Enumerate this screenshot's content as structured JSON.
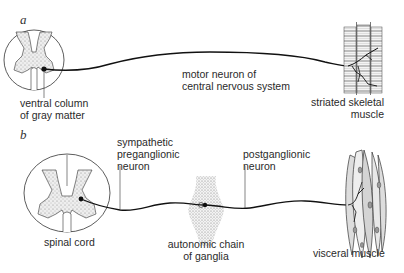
{
  "panels": [
    {
      "letter": "a",
      "labels": {
        "ventral_column": [
          "ventral column",
          "of gray matter"
        ],
        "motor_neuron": [
          "motor neuron of",
          "central nervous system"
        ],
        "effector": [
          "striated skeletal",
          "muscle"
        ]
      }
    },
    {
      "letter": "b",
      "labels": {
        "preganglionic": [
          "sympathetic",
          "preganglionic",
          "neuron"
        ],
        "postganglionic": [
          "postganglionic",
          "neuron"
        ],
        "spinal_cord": [
          "spinal cord"
        ],
        "ganglia": [
          "autonomic chain",
          "of ganglia"
        ],
        "effector": [
          "visceral muscle"
        ]
      }
    }
  ],
  "colors": {
    "ink": "#2a2a2a",
    "stipple": "#7a7a7a",
    "background": "#ffffff"
  }
}
